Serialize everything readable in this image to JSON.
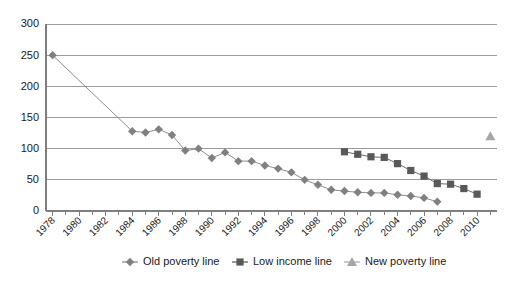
{
  "chart_data": {
    "type": "line",
    "title": "",
    "xlabel": "",
    "ylabel": "",
    "ylim": [
      0,
      300
    ],
    "ytick_values": [
      0,
      50,
      100,
      150,
      200,
      250,
      300
    ],
    "ytick_labels": [
      "0",
      "50",
      "100",
      "150",
      "200",
      "250",
      "300"
    ],
    "xlim": [
      1977.5,
      2011.5
    ],
    "xtick_labels": [
      "1978",
      "1980",
      "1982",
      "1984",
      "1986",
      "1988",
      "1990",
      "1992",
      "1994",
      "1996",
      "1998",
      "2000",
      "2002",
      "2004",
      "2006",
      "2008",
      "2010"
    ],
    "grid": true,
    "legend_position": "bottom",
    "colors": {
      "old_poverty_line": "#808080",
      "low_income_line": "#595959",
      "new_poverty_line": "#a6a6a6",
      "gridline": "#9c9c9c",
      "axis": "#7f7f7f",
      "text": "#1a1a1a",
      "background": "#ffffff"
    },
    "series": [
      {
        "name": "Old poverty line",
        "marker": "diamond",
        "color": "#808080",
        "points": [
          {
            "x": 1978,
            "y": 250
          },
          {
            "x": 1984,
            "y": 128
          },
          {
            "x": 1985,
            "y": 126
          },
          {
            "x": 1986,
            "y": 131
          },
          {
            "x": 1987,
            "y": 122
          },
          {
            "x": 1988,
            "y": 97
          },
          {
            "x": 1989,
            "y": 100
          },
          {
            "x": 1990,
            "y": 85
          },
          {
            "x": 1991,
            "y": 94
          },
          {
            "x": 1992,
            "y": 80
          },
          {
            "x": 1993,
            "y": 80
          },
          {
            "x": 1994,
            "y": 73
          },
          {
            "x": 1995,
            "y": 68
          },
          {
            "x": 1996,
            "y": 62
          },
          {
            "x": 1997,
            "y": 50
          },
          {
            "x": 1998,
            "y": 42
          },
          {
            "x": 1999,
            "y": 34
          },
          {
            "x": 2000,
            "y": 32
          },
          {
            "x": 2001,
            "y": 30
          },
          {
            "x": 2002,
            "y": 29
          },
          {
            "x": 2003,
            "y": 29
          },
          {
            "x": 2004,
            "y": 26
          },
          {
            "x": 2005,
            "y": 24
          },
          {
            "x": 2006,
            "y": 21
          },
          {
            "x": 2007,
            "y": 15
          }
        ]
      },
      {
        "name": "Low income line",
        "marker": "square",
        "color": "#595959",
        "points": [
          {
            "x": 2000,
            "y": 95
          },
          {
            "x": 2001,
            "y": 91
          },
          {
            "x": 2002,
            "y": 87
          },
          {
            "x": 2003,
            "y": 86
          },
          {
            "x": 2004,
            "y": 76
          },
          {
            "x": 2005,
            "y": 65
          },
          {
            "x": 2006,
            "y": 56
          },
          {
            "x": 2007,
            "y": 44
          },
          {
            "x": 2008,
            "y": 43
          },
          {
            "x": 2009,
            "y": 36
          },
          {
            "x": 2010,
            "y": 27
          }
        ]
      },
      {
        "name": "New poverty line",
        "marker": "triangle",
        "color": "#a6a6a6",
        "points": [
          {
            "x": 2011,
            "y": 120
          }
        ]
      }
    ],
    "legend": [
      {
        "label": "Old poverty line",
        "marker": "diamond",
        "color": "#808080"
      },
      {
        "label": "Low income line",
        "marker": "square",
        "color": "#595959"
      },
      {
        "label": "New poverty line",
        "marker": "triangle",
        "color": "#a6a6a6"
      }
    ]
  }
}
